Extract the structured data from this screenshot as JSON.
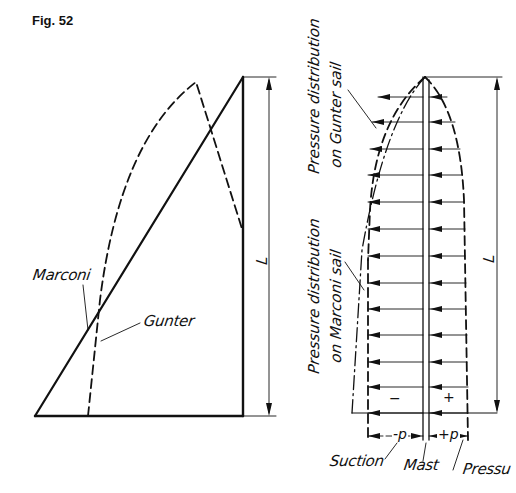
{
  "figure": {
    "label": "Fig. 52"
  },
  "left_diagram": {
    "labels": {
      "marconi": "Marconi",
      "gunter": "Gunter",
      "length": "L"
    },
    "marconi_outline": {
      "boom": [
        [
          35,
          416
        ],
        [
          243,
          416
        ]
      ],
      "mast": [
        [
          243,
          77
        ],
        [
          243,
          416
        ]
      ],
      "leech": [
        [
          35,
          416
        ],
        [
          243,
          77
        ]
      ]
    },
    "gunter_outline": {
      "style": "dashed",
      "luff_foot_x": 88,
      "peak": [
        196,
        82
      ],
      "leech_end": [
        243,
        232
      ]
    },
    "dimension": {
      "x": 269,
      "y_top": 77,
      "y_bottom": 416
    }
  },
  "right_diagram": {
    "labels": {
      "gunter_pressure": [
        "Pressure distribution",
        "on Gunter sail"
      ],
      "marconi_pressure": [
        "Pressure distribution",
        "on Marconi sail"
      ],
      "length": "L",
      "minus": "−",
      "plus": "+",
      "neg_p": "-p",
      "pos_p": "+p",
      "suction": "Suction",
      "mast": "Mast",
      "pressure": "Pressu"
    },
    "mast_x": [
      423,
      429
    ],
    "apex": [
      425,
      77
    ],
    "arrow_rows_y": [
      97,
      122,
      149,
      175,
      202,
      229,
      256,
      283,
      309,
      335,
      362,
      387,
      413
    ],
    "dimension": {
      "x": 497,
      "y_top": 77,
      "y_bottom": 413
    }
  }
}
